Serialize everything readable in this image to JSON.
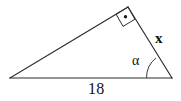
{
  "figure": {
    "type": "geometry-diagram",
    "shape": "triangle",
    "stroke_color": "#2b2b2b",
    "background_color": "#ffffff",
    "labels": {
      "base": "18",
      "side": "x",
      "angle": "α"
    },
    "markers": {
      "right_angle": "right-angle-square-with-dot",
      "angle_arc": "single-arc"
    },
    "vertices": {
      "left": [
        10,
        78
      ],
      "right": [
        172,
        78
      ],
      "apex": [
        128,
        7
      ]
    }
  }
}
